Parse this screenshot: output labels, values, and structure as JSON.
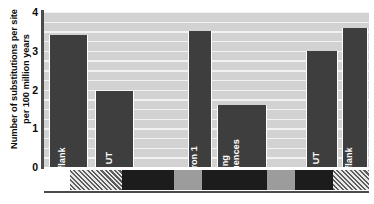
{
  "chart_data": {
    "type": "bar",
    "title": "",
    "xlabel": "",
    "ylabel_lines": [
      "Number of substitutions per site",
      "per 100 million years"
    ],
    "ylim": [
      0,
      4
    ],
    "yticks": [
      4,
      3,
      2,
      1,
      0
    ],
    "grid": true,
    "legend": "none",
    "categories": [
      "5' flank",
      "5' UT",
      "Intron 1",
      "Coding sequences",
      "3' UT",
      "3' flank"
    ],
    "category_label_lines": [
      [
        "5' flank"
      ],
      [
        "5' UT"
      ],
      [
        "Intron 1"
      ],
      [
        "Coding",
        "sequences"
      ],
      [
        "3' UT"
      ],
      [
        "3' flank"
      ]
    ],
    "values": [
      3.4,
      1.95,
      3.5,
      1.6,
      3.0,
      3.6
    ],
    "bar_color": "#3e3e3e",
    "plot_background": "#d2d2d2",
    "gridline_color": "#f2f2f2",
    "axis_color": "#4b4b4b",
    "bar_geometry": [
      {
        "left_pct": 1.5,
        "width_pct": 12.0
      },
      {
        "left_pct": 15.7,
        "width_pct": 12.0
      },
      {
        "left_pct": 44.3,
        "width_pct": 7.4
      },
      {
        "left_pct": 53.2,
        "width_pct": 15.4
      },
      {
        "left_pct": 80.6,
        "width_pct": 9.8
      },
      {
        "left_pct": 91.7,
        "width_pct": 8.0
      }
    ],
    "gene_diagram": {
      "segments": [
        {
          "name": "5-flank-region",
          "style": "white",
          "left_pct": 0.0,
          "width_pct": 8.0
        },
        {
          "name": "5-UT-region",
          "style": "hatch",
          "left_pct": 8.0,
          "width_pct": 16.0
        },
        {
          "name": "exon-1",
          "style": "dark",
          "left_pct": 24.0,
          "width_pct": 16.0
        },
        {
          "name": "intron-1",
          "style": "mid",
          "left_pct": 40.0,
          "width_pct": 8.6
        },
        {
          "name": "exon-2",
          "style": "dark",
          "left_pct": 48.6,
          "width_pct": 20.0
        },
        {
          "name": "intron-2",
          "style": "mid",
          "left_pct": 68.6,
          "width_pct": 8.6
        },
        {
          "name": "exon-3",
          "style": "dark",
          "left_pct": 77.2,
          "width_pct": 11.8
        },
        {
          "name": "3-UT-region",
          "style": "hatch",
          "left_pct": 89.0,
          "width_pct": 11.0
        }
      ]
    }
  }
}
